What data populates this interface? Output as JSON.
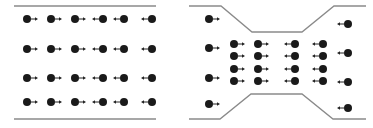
{
  "colors": {
    "wall": "#8a8a8a",
    "particle": "#1a1a1a",
    "arrow": "#222222",
    "background": "#ffffff"
  },
  "panels": [
    {
      "id": "uniform-channel",
      "walls": [
        [
          [
            14,
            6
          ],
          [
            156,
            6
          ]
        ],
        [
          [
            14,
            119
          ],
          [
            156,
            119
          ]
        ]
      ],
      "particles": [
        {
          "x": 27,
          "y": 19,
          "dir": "right"
        },
        {
          "x": 51,
          "y": 19,
          "dir": "right"
        },
        {
          "x": 75,
          "y": 19,
          "dir": "right"
        },
        {
          "x": 103,
          "y": 19,
          "dir": "left"
        },
        {
          "x": 124,
          "y": 19,
          "dir": "left"
        },
        {
          "x": 152,
          "y": 19,
          "dir": "left"
        },
        {
          "x": 27,
          "y": 49,
          "dir": "right"
        },
        {
          "x": 51,
          "y": 49,
          "dir": "right"
        },
        {
          "x": 75,
          "y": 49,
          "dir": "right"
        },
        {
          "x": 103,
          "y": 49,
          "dir": "left"
        },
        {
          "x": 124,
          "y": 49,
          "dir": "left"
        },
        {
          "x": 152,
          "y": 49,
          "dir": "left"
        },
        {
          "x": 27,
          "y": 78,
          "dir": "right"
        },
        {
          "x": 51,
          "y": 78,
          "dir": "right"
        },
        {
          "x": 75,
          "y": 78,
          "dir": "right"
        },
        {
          "x": 103,
          "y": 78,
          "dir": "left"
        },
        {
          "x": 124,
          "y": 78,
          "dir": "left"
        },
        {
          "x": 152,
          "y": 78,
          "dir": "left"
        },
        {
          "x": 27,
          "y": 102,
          "dir": "right"
        },
        {
          "x": 51,
          "y": 102,
          "dir": "right"
        },
        {
          "x": 75,
          "y": 102,
          "dir": "right"
        },
        {
          "x": 103,
          "y": 102,
          "dir": "left"
        },
        {
          "x": 124,
          "y": 102,
          "dir": "left"
        },
        {
          "x": 152,
          "y": 102,
          "dir": "left"
        }
      ]
    },
    {
      "id": "constricted-channel",
      "walls": [
        [
          [
            189,
            6
          ],
          [
            221,
            6
          ],
          [
            252,
            32
          ],
          [
            302,
            32
          ],
          [
            334,
            6
          ],
          [
            366,
            6
          ]
        ],
        [
          [
            189,
            119
          ],
          [
            220,
            119
          ],
          [
            251,
            94
          ],
          [
            302,
            94
          ],
          [
            333,
            119
          ],
          [
            366,
            119
          ]
        ]
      ],
      "particles": [
        {
          "x": 209,
          "y": 19,
          "dir": "right"
        },
        {
          "x": 209,
          "y": 48,
          "dir": "right"
        },
        {
          "x": 209,
          "y": 78,
          "dir": "right"
        },
        {
          "x": 209,
          "y": 104,
          "dir": "right"
        },
        {
          "x": 234,
          "y": 44,
          "dir": "right"
        },
        {
          "x": 234,
          "y": 56,
          "dir": "right"
        },
        {
          "x": 234,
          "y": 69,
          "dir": "right"
        },
        {
          "x": 234,
          "y": 81,
          "dir": "right"
        },
        {
          "x": 258,
          "y": 44,
          "dir": "right"
        },
        {
          "x": 258,
          "y": 56,
          "dir": "right"
        },
        {
          "x": 258,
          "y": 69,
          "dir": "right"
        },
        {
          "x": 258,
          "y": 81,
          "dir": "right"
        },
        {
          "x": 295,
          "y": 44,
          "dir": "left"
        },
        {
          "x": 295,
          "y": 56,
          "dir": "left"
        },
        {
          "x": 295,
          "y": 69,
          "dir": "left"
        },
        {
          "x": 295,
          "y": 81,
          "dir": "left"
        },
        {
          "x": 323,
          "y": 44,
          "dir": "left"
        },
        {
          "x": 323,
          "y": 56,
          "dir": "left"
        },
        {
          "x": 323,
          "y": 69,
          "dir": "left"
        },
        {
          "x": 323,
          "y": 81,
          "dir": "left"
        },
        {
          "x": 348,
          "y": 24,
          "dir": "left"
        },
        {
          "x": 348,
          "y": 53,
          "dir": "left"
        },
        {
          "x": 348,
          "y": 82,
          "dir": "left"
        },
        {
          "x": 348,
          "y": 108,
          "dir": "left"
        }
      ]
    }
  ],
  "particle_radius": 4,
  "arrow_length": 7
}
